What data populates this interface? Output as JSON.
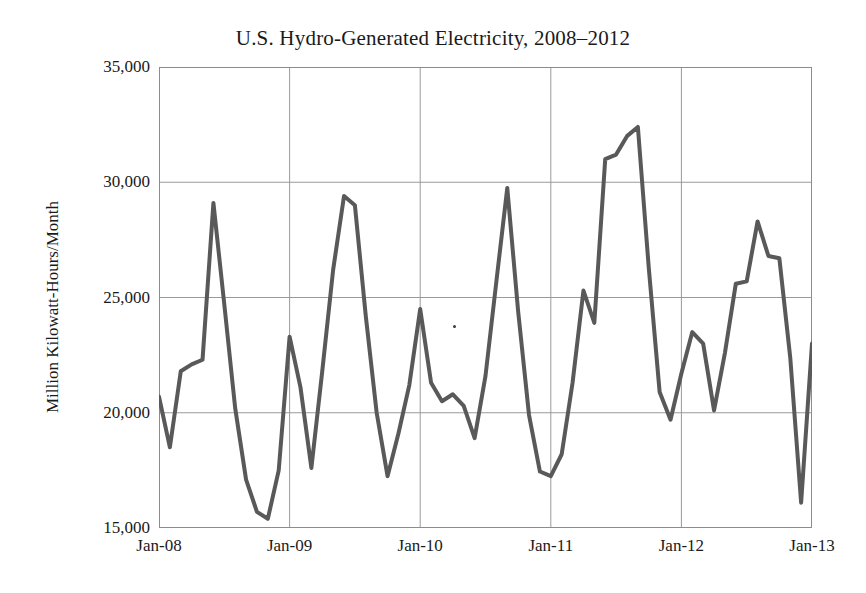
{
  "chart_data": {
    "type": "line",
    "title": "U.S. Hydro-Generated Electricity, 2008–2012",
    "xlabel": "",
    "ylabel": "Million Kilowatt-Hours/Month",
    "ylim": [
      15000,
      35000
    ],
    "ytick_labels": [
      "15,000",
      "20,000",
      "25,000",
      "30,000",
      "35,000"
    ],
    "ytick_values": [
      15000,
      20000,
      25000,
      30000,
      35000
    ],
    "xtick_labels": [
      "Jan-08",
      "Jan-09",
      "Jan-10",
      "Jan-11",
      "Jan-12",
      "Jan-13"
    ],
    "xtick_values": [
      0,
      12,
      24,
      36,
      48,
      60
    ],
    "grid": true,
    "legend": "none",
    "line_color": "#595959",
    "line_width": 4,
    "x": [
      "Jan-08",
      "Feb-08",
      "Mar-08",
      "Apr-08",
      "May-08",
      "Jun-08",
      "Jul-08",
      "Aug-08",
      "Sep-08",
      "Oct-08",
      "Nov-08",
      "Dec-08",
      "Jan-09",
      "Feb-09",
      "Mar-09",
      "Apr-09",
      "May-09",
      "Jun-09",
      "Jul-09",
      "Aug-09",
      "Sep-09",
      "Oct-09",
      "Nov-09",
      "Dec-09",
      "Jan-10",
      "Feb-10",
      "Mar-10",
      "Apr-10",
      "May-10",
      "Jun-10",
      "Jul-10",
      "Aug-10",
      "Sep-10",
      "Oct-10",
      "Nov-10",
      "Dec-10",
      "Jan-11",
      "Feb-11",
      "Mar-11",
      "Apr-11",
      "May-11",
      "Jun-11",
      "Jul-11",
      "Aug-11",
      "Sep-11",
      "Oct-11",
      "Nov-11",
      "Dec-11",
      "Jan-12",
      "Feb-12",
      "Mar-12",
      "Apr-12",
      "May-12",
      "Jun-12",
      "Jul-12",
      "Aug-12",
      "Sep-12",
      "Oct-12",
      "Nov-12",
      "Dec-12",
      "Jan-13"
    ],
    "values": [
      20700,
      18500,
      21800,
      22100,
      22300,
      29100,
      24700,
      20200,
      17100,
      15700,
      15400,
      17500,
      23300,
      21100,
      17600,
      21800,
      26200,
      29400,
      29000,
      24200,
      20000,
      17250,
      19100,
      21200,
      24500,
      21300,
      20500,
      20800,
      20300,
      18900,
      21600,
      25700,
      29750,
      24400,
      19900,
      17450,
      17250,
      18200,
      21300,
      25300,
      23900,
      31000,
      31200,
      32000,
      32400,
      26300,
      20900,
      19700,
      21700,
      23500,
      23000,
      20100,
      22600,
      25600,
      25700,
      28300,
      26800,
      26700,
      22400,
      16100,
      23000
    ],
    "series_name": "U.S. Hydro-Generated Electricity"
  }
}
